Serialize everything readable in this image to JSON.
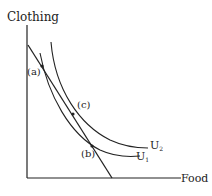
{
  "diagram": {
    "y_axis_label": "Clothing",
    "x_axis_label": "Food",
    "curves": [
      {
        "name": "U",
        "subscript": "1"
      },
      {
        "name": "U",
        "subscript": "2"
      }
    ],
    "points": {
      "a": "(a)",
      "b": "(b)",
      "c": "(c)"
    },
    "line_color": "#222222"
  }
}
